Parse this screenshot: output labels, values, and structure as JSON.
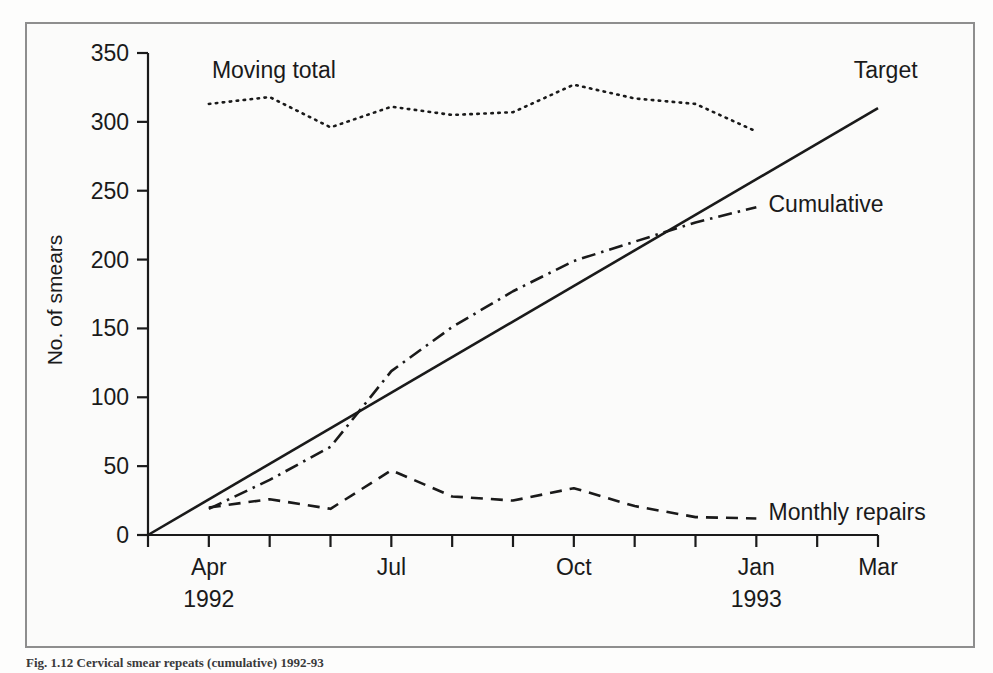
{
  "figure": {
    "caption": "Fig. 1.12 Cervical smear repeats (cumulative) 1992-93",
    "border_color": "#8e8e8e",
    "background_color": "#fbfbfa",
    "ink_color": "#1a1a1a"
  },
  "chart_data": {
    "type": "line",
    "title": "",
    "xlabel": "",
    "ylabel": "No. of smears",
    "ylim": [
      0,
      350
    ],
    "ytick_values": [
      0,
      50,
      100,
      150,
      200,
      250,
      300,
      350
    ],
    "ytick_labels": [
      "0",
      "50",
      "100",
      "150",
      "200",
      "250",
      "300",
      "350"
    ],
    "grid": false,
    "legend_position": "inline-labels",
    "x_axis": {
      "tick_count": 13,
      "tick_index_range": [
        0,
        12
      ],
      "labeled_ticks": [
        {
          "index": 1,
          "label": "Apr",
          "year": "1992"
        },
        {
          "index": 4,
          "label": "Jul",
          "year": ""
        },
        {
          "index": 7,
          "label": "Oct",
          "year": ""
        },
        {
          "index": 10,
          "label": "Jan",
          "year": "1993"
        },
        {
          "index": 12,
          "label": "Mar",
          "year": ""
        }
      ],
      "months": [
        "Mar",
        "Apr",
        "May",
        "Jun",
        "Jul",
        "Aug",
        "Sep",
        "Oct",
        "Nov",
        "Dec",
        "Jan",
        "Feb",
        "Mar"
      ]
    },
    "series": [
      {
        "name": "Moving total",
        "style": "dotted",
        "label": "Moving total",
        "label_x_index": 1.05,
        "label_y": 338,
        "x_index": [
          1,
          2,
          3,
          4,
          5,
          6,
          7,
          8,
          9,
          10
        ],
        "values": [
          313,
          318,
          296,
          311,
          305,
          307,
          327,
          317,
          313,
          293
        ]
      },
      {
        "name": "Target",
        "style": "solid",
        "label": "Target",
        "label_x_index": 11.6,
        "label_y": 338,
        "x_index": [
          0,
          12
        ],
        "values": [
          0,
          310
        ]
      },
      {
        "name": "Cumulative",
        "style": "dash-dot",
        "label": "Cumulative",
        "label_x_index": 10.2,
        "label_y": 240,
        "x_index": [
          1,
          2,
          3,
          4,
          5,
          6,
          7,
          8,
          9,
          10
        ],
        "values": [
          19,
          40,
          64,
          119,
          151,
          177,
          199,
          213,
          227,
          238
        ]
      },
      {
        "name": "Monthly repairs",
        "style": "dashed",
        "label": "Monthly repairs",
        "label_x_index": 10.2,
        "label_y": 17,
        "x_index": [
          1,
          2,
          3,
          4,
          5,
          6,
          7,
          8,
          9,
          10
        ],
        "values": [
          20,
          26,
          19,
          47,
          28,
          25,
          34,
          21,
          13,
          12
        ]
      }
    ]
  }
}
